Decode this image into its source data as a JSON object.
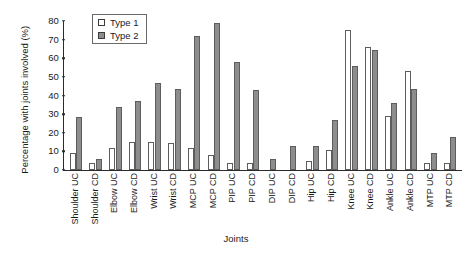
{
  "chart_data": {
    "type": "bar",
    "title": "",
    "xlabel": "Joints",
    "ylabel": "Percentage with joints involved (%)",
    "ylim": [
      0,
      80
    ],
    "yticks": [
      0,
      10,
      20,
      30,
      40,
      50,
      60,
      70,
      80
    ],
    "grid": false,
    "legend_position": "top-left-inside",
    "categories": [
      "Shoulder UC",
      "Shoulder CD",
      "Elbow UC",
      "Elbow CD",
      "Wrist UC",
      "Wrist CD",
      "MCP UC",
      "MCP CD",
      "PIP UC",
      "PIP CD",
      "DIP UC",
      "DIP CD",
      "Hip UC",
      "Hip CD",
      "Knee UC",
      "Knee CD",
      "Ankle UC",
      "Ankle CD",
      "MTP UC",
      "MTP CD"
    ],
    "series": [
      {
        "name": "Type 1",
        "color": "#ffffff",
        "values": [
          9,
          4,
          12,
          15,
          15,
          14.5,
          12,
          8,
          4,
          4,
          0,
          0,
          5,
          11,
          75,
          66,
          29,
          53,
          4,
          4
        ]
      },
      {
        "name": "Type 2",
        "color": "#8d8d8d",
        "values": [
          28.5,
          6,
          34,
          37,
          46.5,
          43.5,
          72,
          79,
          58,
          43,
          6,
          13,
          13,
          27,
          56,
          64.5,
          36,
          43.5,
          9,
          17.5
        ]
      }
    ]
  },
  "legend": {
    "entries": [
      {
        "label": "Type 1"
      },
      {
        "label": "Type 2"
      }
    ]
  }
}
